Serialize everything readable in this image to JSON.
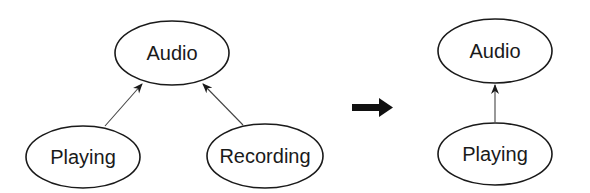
{
  "diagram": {
    "left": {
      "nodes": [
        {
          "id": "audio",
          "label": "Audio"
        },
        {
          "id": "playing",
          "label": "Playing"
        },
        {
          "id": "recording",
          "label": "Recording"
        }
      ],
      "edges": [
        {
          "from": "playing",
          "to": "audio"
        },
        {
          "from": "recording",
          "to": "audio"
        }
      ]
    },
    "transition": {
      "icon": "right-arrow-icon"
    },
    "right": {
      "nodes": [
        {
          "id": "audio",
          "label": "Audio"
        },
        {
          "id": "playing",
          "label": "Playing"
        }
      ],
      "edges": [
        {
          "from": "playing",
          "to": "audio"
        }
      ]
    }
  }
}
